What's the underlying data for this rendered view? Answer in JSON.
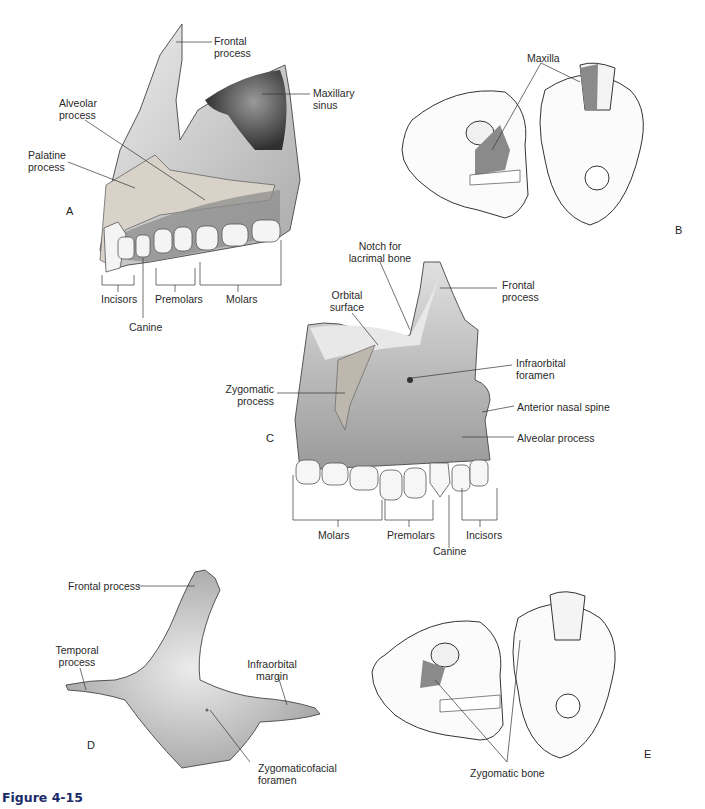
{
  "figure": {
    "caption": "Figure 4-15",
    "caption_color": "#1a2a6a",
    "bone_fill": "#d9d9d9",
    "highlight_fill": "#8a8a8a"
  },
  "panels": {
    "A": {
      "letter": "A",
      "labels": {
        "frontal_process": [
          "Frontal",
          "process"
        ],
        "maxillary_sinus": [
          "Maxillary",
          "sinus"
        ],
        "alveolar_process": [
          "Alveolar",
          "process"
        ],
        "palatine_process": [
          "Palatine",
          "process"
        ],
        "incisors": "Incisors",
        "premolars": "Premolars",
        "molars": "Molars",
        "canine": "Canine"
      }
    },
    "B": {
      "letter": "B",
      "labels": {
        "maxilla": "Maxilla"
      }
    },
    "C": {
      "letter": "C",
      "labels": {
        "notch_lacrimal": [
          "Notch for",
          "lacrimal bone"
        ],
        "frontal_process": [
          "Frontal",
          "process"
        ],
        "orbital_surface": [
          "Orbital",
          "surface"
        ],
        "infraorbital_foramen": [
          "Infraorbital",
          "foramen"
        ],
        "zygomatic_process": [
          "Zygomatic",
          "process"
        ],
        "anterior_nasal_spine": "Anterior nasal spine",
        "alveolar_process": "Alveolar process",
        "molars": "Molars",
        "premolars": "Premolars",
        "incisors": "Incisors",
        "canine": "Canine"
      }
    },
    "D": {
      "letter": "D",
      "labels": {
        "frontal_process": "Frontal process",
        "temporal_process": [
          "Temporal",
          "process"
        ],
        "infraorbital_margin": [
          "Infraorbital",
          "margin"
        ],
        "zygomaticofacial_foramen": [
          "Zygomaticofacial",
          "foramen"
        ]
      }
    },
    "E": {
      "letter": "E",
      "labels": {
        "zygomatic_bone": "Zygomatic bone"
      }
    }
  }
}
